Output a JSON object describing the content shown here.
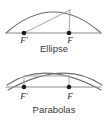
{
  "figure": {
    "background_color": "#ffffff",
    "width": 109,
    "height": 120,
    "colors": {
      "curve": "#6e6e6e",
      "axis": "#8a8a8a",
      "ray": "#9a9a9a",
      "chord": "#a3a3a3",
      "focus_dot": "#1a1a1a",
      "caption_text": "#3a3a3a",
      "label_text": "#2b2b2b"
    }
  },
  "panels": [
    {
      "id": "ellipse-panel",
      "caption": "Ellipse",
      "caption_position": {
        "x": 54,
        "y": 52
      },
      "axis": {
        "x1": 6,
        "y1": 33,
        "x2": 101,
        "y2": 33
      },
      "curve_path": "M 6 33 Q 53.5 -9 101 33",
      "apex_point": {
        "x": 70,
        "y": 10
      },
      "foci": [
        {
          "label": "F'",
          "name": "focus-left",
          "x": 24,
          "y": 33,
          "label_x": 24,
          "label_y": 43,
          "ray_to_apex": {
            "x1": 24,
            "y1": 33,
            "x2": 70,
            "y2": 10
          }
        },
        {
          "label": "F",
          "name": "focus-right",
          "x": 69,
          "y": 33,
          "label_x": 70,
          "label_y": 43,
          "ray_to_apex": {
            "x1": 69,
            "y1": 33,
            "x2": 70,
            "y2": 10
          }
        }
      ]
    },
    {
      "id": "parabolas-panel",
      "caption": "Parabolas",
      "caption_position": {
        "x": 54,
        "y": 113
      },
      "axis": {
        "x1": 6,
        "y1": 87,
        "x2": 101,
        "y2": 87
      },
      "curve_paths": [
        "M 7 85 Q 45 59 101 90",
        "M 102 85 Q 64 59 8 90"
      ],
      "chord": {
        "x1": 24,
        "y1": 76,
        "x2": 69,
        "y2": 76
      },
      "apex_point": {
        "x": 54,
        "y": 66
      },
      "foci": [
        {
          "label": "F'",
          "name": "focus-left",
          "x": 24,
          "y": 87,
          "label_x": 24,
          "label_y": 99
        },
        {
          "label": "F",
          "name": "focus-right",
          "x": 69,
          "y": 87,
          "label_x": 70,
          "label_y": 99
        }
      ]
    }
  ]
}
